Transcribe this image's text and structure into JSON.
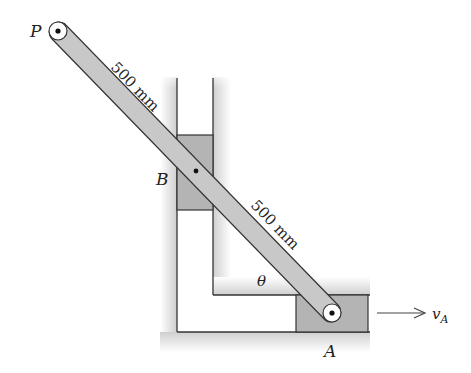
{
  "diagram": {
    "type": "slider-crank mechanism with two perpendicular guides",
    "labels": {
      "point_p": "P",
      "point_b": "B",
      "point_a": "A",
      "angle": "θ",
      "velocity": "v",
      "velocity_sub": "A"
    },
    "dimensions": {
      "upper_segment": "500 mm",
      "lower_segment": "500 mm"
    },
    "colors": {
      "bar_fill": "#c8c8c8",
      "slider_fill": "#b4b4b4",
      "guide_shade": "#d2d2d2",
      "stroke": "#333333",
      "background": "#ffffff"
    }
  }
}
